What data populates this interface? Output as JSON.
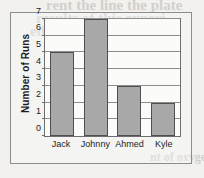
{
  "background": {
    "paper_color": "#f2f1ee",
    "bleed_through_text": {
      "line1": "rent the line  the plate",
      "line2": "results of this experi",
      "line3": "ed in the table belo",
      "line4": "nt of oxygen"
    }
  },
  "chart_data": {
    "type": "bar",
    "title": "",
    "xlabel": "",
    "ylabel": "Number of Runs",
    "categories": [
      "Jack",
      "Johnny",
      "Ahmed",
      "Kyle"
    ],
    "values": [
      5,
      7,
      3,
      2
    ],
    "ylim": [
      0,
      7
    ],
    "yticks": [
      0,
      1,
      2,
      3,
      4,
      5,
      6,
      7
    ],
    "ytick_labels": [
      "0",
      "1",
      "2",
      "3",
      "4",
      "5",
      "6",
      "7"
    ],
    "grid": true,
    "grid_axis": "y",
    "legend": false,
    "bar_color": "#a8a8a8",
    "bar_border_color": "#4f4f4f",
    "axis_color": "#6e6e6e",
    "gridline_color": "#8e8e8e",
    "text_color": "#1c1c1c"
  }
}
